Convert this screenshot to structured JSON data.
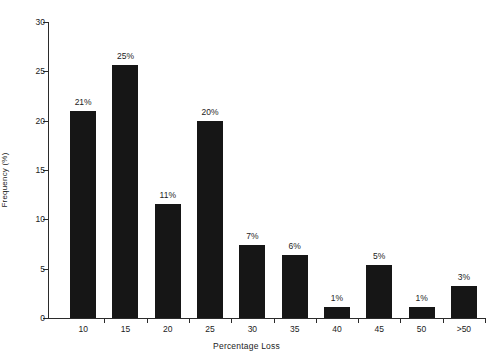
{
  "chart_data": {
    "type": "bar",
    "title": "",
    "xlabel": "Percentage Loss",
    "ylabel": "Frequency (%)",
    "categories": [
      "10",
      "15",
      "20",
      "25",
      "30",
      "35",
      "40",
      "45",
      "50",
      ">50"
    ],
    "values": [
      21,
      25,
      11,
      20,
      7,
      6,
      1,
      5,
      1,
      3
    ],
    "plotted_heights": [
      21.0,
      25.6,
      11.6,
      20.0,
      7.4,
      6.4,
      1.1,
      5.4,
      1.1,
      3.2
    ],
    "data_labels": [
      "21%",
      "25%",
      "11%",
      "20%",
      "7%",
      "6%",
      "1%",
      "5%",
      "1%",
      "3%"
    ],
    "ylim": [
      0,
      30
    ],
    "y_ticks": [
      0,
      5,
      10,
      15,
      20,
      25,
      30
    ],
    "y_tick_labels": [
      "0",
      "5",
      "10",
      "15",
      "20",
      "25",
      "30"
    ],
    "grid": false,
    "legend": false,
    "legend_position": "none",
    "bar_color": "#161616",
    "axis_color": "#2b2b2b",
    "text_color": "#1c1c1c",
    "background_color": "#ffffff"
  }
}
